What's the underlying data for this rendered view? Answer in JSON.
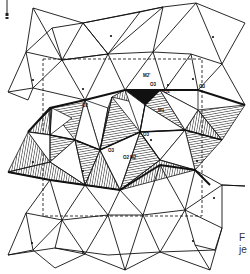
{
  "figure": {
    "type": "crystal-structure-projection",
    "labels": {
      "m1": "M1",
      "m2": "M2",
      "m2_prime": "M2'",
      "o2_a": "O2",
      "o2_b": "O2",
      "o2_c": "O2",
      "o3_a": "O3",
      "o3_b": "O3",
      "o3_c": "O3",
      "o3_d": "O3",
      "o1": "O1"
    },
    "caption_lines": [
      "F",
      "je"
    ],
    "unit_cell": "dashed rectangle",
    "colors": {
      "line": "#111111",
      "hatch": "#222222",
      "background": "#ffffff"
    }
  }
}
